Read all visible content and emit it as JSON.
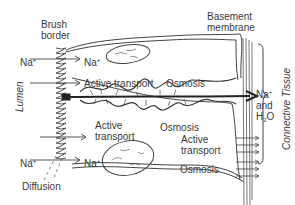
{
  "diagram": {
    "title_labels": {
      "brush_border": [
        "Brush",
        "border"
      ],
      "basement_membrane": [
        "Basement",
        "membrane"
      ],
      "lumen": "Lumen",
      "connective_tissue": "Connective Tissue"
    },
    "ions": {
      "na_top_left": "Na",
      "na_top_right": "Na",
      "na_bottom_left": "Na",
      "na_bottom_right": "Na",
      "charge": "+"
    },
    "processes": {
      "active_transport_top": "Active transport",
      "osmosis_top": "Osmosis",
      "active_1": "Active",
      "transport_1": "transport",
      "osmosis_mid": "Osmosis",
      "active_2": "Active",
      "transport_2": "transport",
      "osmosis_bottom": "Osmosis",
      "diffusion": "Diffusion"
    },
    "output": {
      "na": "Na",
      "charge": "+",
      "and": "and",
      "h": "H",
      "sub2": "2",
      "o": "O"
    },
    "colors": {
      "line": "#444444",
      "text": "#3a3a3a",
      "background": "#ffffff"
    }
  }
}
